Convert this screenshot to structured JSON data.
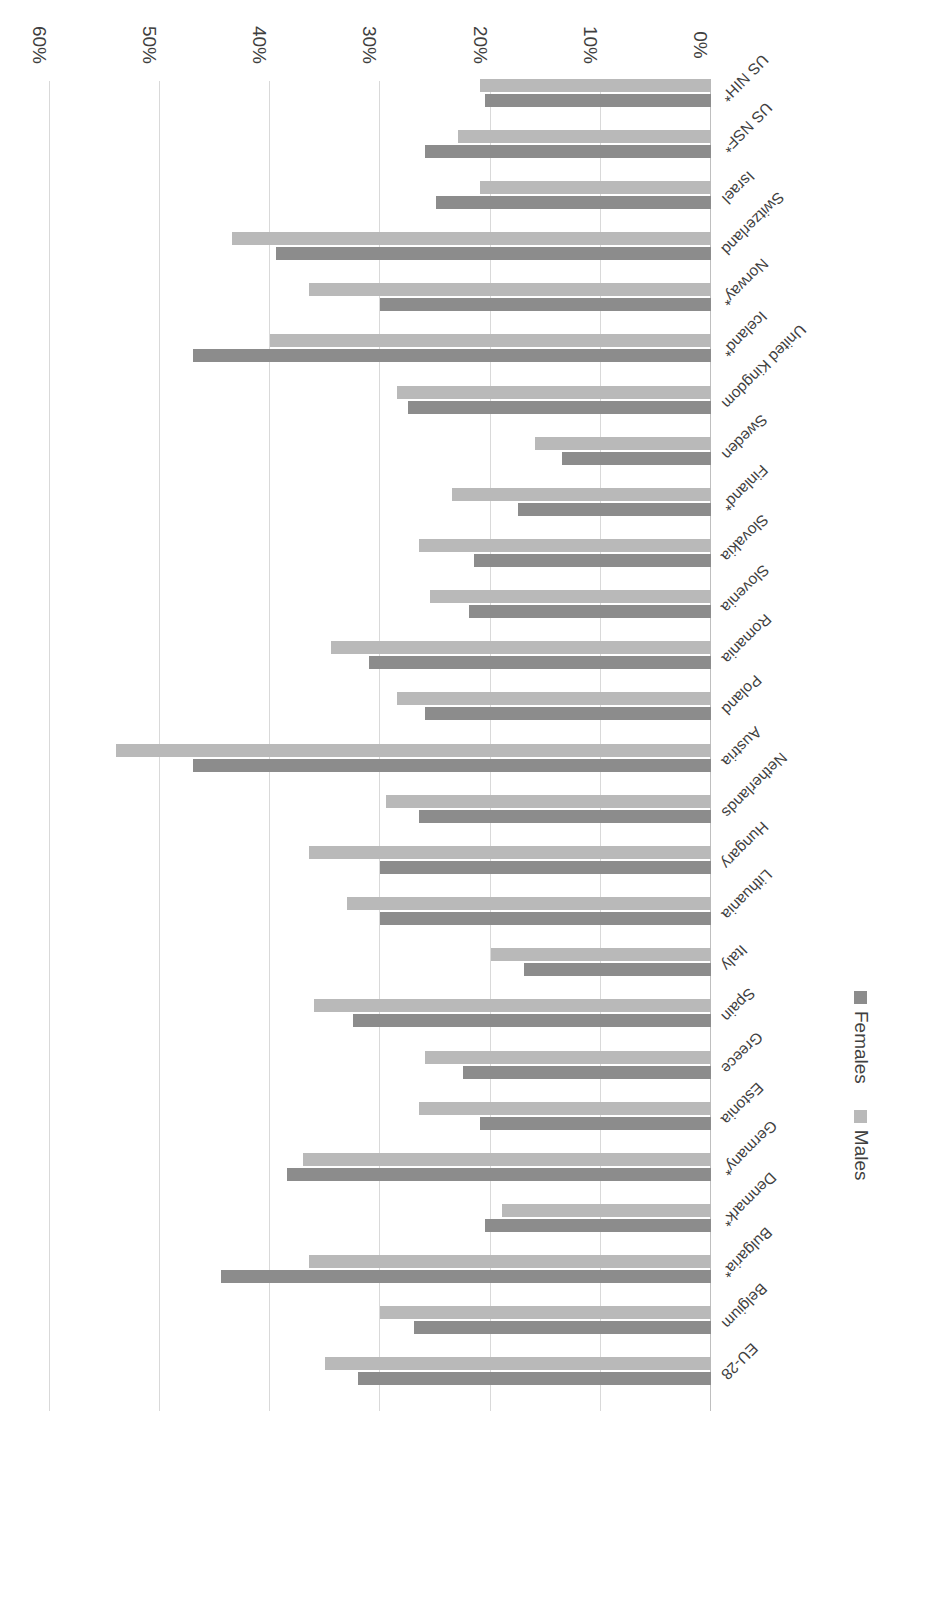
{
  "chart_data": {
    "type": "bar",
    "orientation": "horizontal",
    "title": "",
    "xlabel": "",
    "ylabel": "",
    "xlim": [
      0,
      0.6
    ],
    "grid": true,
    "legend_position": "right-middle",
    "tick_labels": [
      "0%",
      "10%",
      "20%",
      "30%",
      "40%",
      "50%",
      "60%"
    ],
    "tick_values": [
      0,
      10,
      20,
      30,
      40,
      50,
      60
    ],
    "categories": [
      "EU-28",
      "Belgium",
      "Bulgaria*",
      "Denmark*",
      "Germany*",
      "Estonia",
      "Greece",
      "Spain",
      "Italy",
      "Lithuania",
      "Hungary",
      "Netherlands",
      "Austria",
      "Poland",
      "Romania",
      "Slovenia",
      "Slovakia",
      "Finland*",
      "Sweden",
      "United Kingdom",
      "Iceland*",
      "Norway*",
      "Switzerland",
      "Israel",
      "US NSF*",
      "US NIH*"
    ],
    "series": [
      {
        "name": "Females",
        "color": "#8c8c8c",
        "values": [
          32,
          27,
          44.5,
          20.5,
          38.5,
          21,
          22.5,
          32.5,
          17,
          30,
          30,
          26.5,
          47,
          26,
          31,
          22,
          21.5,
          17.5,
          13.5,
          27.5,
          47,
          30,
          39.5,
          25,
          26,
          20.5
        ]
      },
      {
        "name": "Males",
        "color": "#b9b9b9",
        "values": [
          35,
          30,
          36.5,
          19,
          37,
          26.5,
          26,
          36,
          20,
          33,
          36.5,
          29.5,
          54,
          28.5,
          34.5,
          25.5,
          26.5,
          23.5,
          16,
          28.5,
          40,
          36.5,
          43.5,
          21,
          23,
          21
        ]
      }
    ]
  },
  "legend": {
    "items": [
      {
        "label": "Females",
        "color": "#8c8c8c"
      },
      {
        "label": "Males",
        "color": "#b9b9b9"
      }
    ]
  }
}
